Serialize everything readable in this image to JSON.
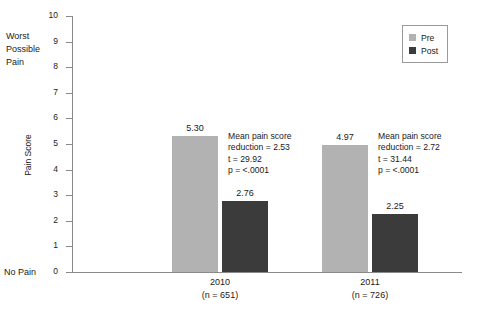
{
  "chart_data": {
    "type": "bar",
    "title": "",
    "xlabel": "",
    "ylabel": "Pain Score",
    "ylim": [
      0,
      10
    ],
    "ytick_labels": [
      "10",
      "9",
      "8",
      "7",
      "6",
      "5",
      "4",
      "3",
      "2",
      "1",
      "0"
    ],
    "grid": false,
    "legend_position": "top-right",
    "categories": [
      "2010",
      "2011"
    ],
    "category_sublabels": [
      "(n = 651)",
      "(n = 726)"
    ],
    "series": [
      {
        "name": "Pre",
        "color": "#b2b2b2",
        "values": [
          5.3,
          4.97
        ],
        "value_labels": [
          "5.30",
          "4.97"
        ]
      },
      {
        "name": "Post",
        "color": "#3b3b3b",
        "values": [
          2.76,
          2.25
        ],
        "value_labels": [
          "2.76",
          "2.25"
        ]
      }
    ],
    "annotations": [
      {
        "group": "2010",
        "line1": "Mean pain score",
        "line2": "reduction = 2.53",
        "line3": "t = 29.92",
        "line4": "p = <.0001"
      },
      {
        "group": "2011",
        "line1": "Mean pain score",
        "line2": "reduction = 2.72",
        "line3": "t = 31.44",
        "line4": "p = <.0001"
      }
    ],
    "axis_anchors": {
      "top": "Worst Possible Pain",
      "top_line1": "Worst",
      "top_line2": "Possible",
      "top_line3": "Pain",
      "bottom": "No Pain"
    }
  },
  "legend": {
    "items": [
      {
        "label": "Pre",
        "color": "#b2b2b2"
      },
      {
        "label": "Post",
        "color": "#3b3b3b"
      }
    ]
  }
}
